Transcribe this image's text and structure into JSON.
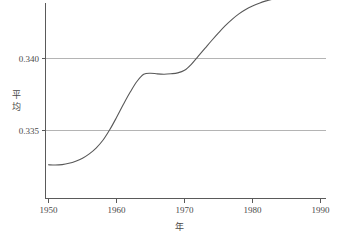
{
  "chart_data": {
    "type": "line",
    "title": "",
    "subtitle": "",
    "xlabel": "年",
    "ylabel": "平均",
    "ylabel_chars": [
      "平",
      "均"
    ],
    "xlim": [
      1949,
      1990
    ],
    "ylim": [
      0.33215,
      0.34435
    ],
    "grid": true,
    "legend_position": "none",
    "x_ticks": [
      1950,
      1960,
      1970,
      1980,
      1990
    ],
    "x_tick_labels": [
      "1950",
      "1960",
      "1970",
      "1980",
      "1990"
    ],
    "y_ticks": [
      0.335,
      0.34
    ],
    "y_tick_labels": [
      "0.335",
      "0.340"
    ],
    "series": [
      {
        "name": "平均",
        "color": "#585858",
        "x": [
          1950,
          1951,
          1952,
          1953,
          1954,
          1955,
          1956,
          1957,
          1958,
          1959,
          1960,
          1961,
          1962,
          1963,
          1964,
          1965,
          1966,
          1967,
          1968,
          1969,
          1970,
          1971,
          1972,
          1973,
          1974,
          1975,
          1976,
          1977,
          1978,
          1979,
          1980,
          1981,
          1982,
          1983,
          1984,
          1985,
          1986,
          1987,
          1988,
          1989
        ],
        "values": [
          0.33262,
          0.3326,
          0.33263,
          0.33272,
          0.33287,
          0.33308,
          0.33338,
          0.33378,
          0.33432,
          0.33505,
          0.3359,
          0.3368,
          0.33765,
          0.3384,
          0.3389,
          0.33898,
          0.33893,
          0.33891,
          0.33894,
          0.339,
          0.33918,
          0.3396,
          0.34015,
          0.3407,
          0.34125,
          0.34178,
          0.34228,
          0.34272,
          0.3431,
          0.3434,
          0.34364,
          0.34384,
          0.344,
          0.34412,
          0.34421,
          0.34427,
          0.34431,
          0.34433,
          0.34434,
          0.34434
        ]
      }
    ],
    "annotations": []
  },
  "axis_colors": {
    "axis": "#5a5a5a",
    "grid": "#b4b4b4",
    "curve": "#585858",
    "text": "#4a4a4a",
    "background": "#ffffff"
  }
}
